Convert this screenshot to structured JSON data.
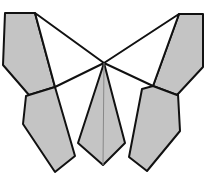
{
  "diagram": {
    "colors": {
      "fill": "#c4c4c4",
      "stroke": "#111111",
      "background": "#ffffff"
    },
    "center": [
      104,
      63
    ],
    "shapes": [
      {
        "name": "upper-left-wing",
        "shaded": true,
        "points": "5,13 35,13 55,87 29,95 3,65"
      },
      {
        "name": "upper-right-wing",
        "shaded": true,
        "points": "179,14 203,14 203,67 177,95 153,86"
      },
      {
        "name": "lower-left-wing",
        "shaded": true,
        "points": "29,95 55,87 75,156 55,172 23,124 26,96"
      },
      {
        "name": "lower-right-wing",
        "shaded": true,
        "points": "153,86 177,95 178,94 180,131 147,171 129,157 142,89"
      },
      {
        "name": "body",
        "shaded": true,
        "points": "104,63 125,143 103,165 78,143"
      },
      {
        "name": "upper-left-white-triangle",
        "shaded": false,
        "points": "35,13 104,63 55,87"
      },
      {
        "name": "upper-right-white-triangle",
        "shaded": false,
        "points": "179,14 104,63 153,86"
      }
    ],
    "lines": [
      {
        "name": "body-midline",
        "from": [
          104,
          63
        ],
        "to": [
          103,
          165
        ]
      }
    ]
  }
}
